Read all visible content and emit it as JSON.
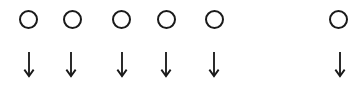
{
  "diagram": {
    "stroke_color": "#1a1a1a",
    "items": [
      {
        "circle_x": 28,
        "arrow_x": 29
      },
      {
        "circle_x": 72,
        "arrow_x": 71
      },
      {
        "circle_x": 121,
        "arrow_x": 122
      },
      {
        "circle_x": 166,
        "arrow_x": 166
      },
      {
        "circle_x": 214,
        "arrow_x": 214
      },
      {
        "circle_x": 338,
        "arrow_x": 340
      }
    ],
    "circle_y": 19,
    "arrow_top": 52,
    "arrow_bottom": 78
  }
}
